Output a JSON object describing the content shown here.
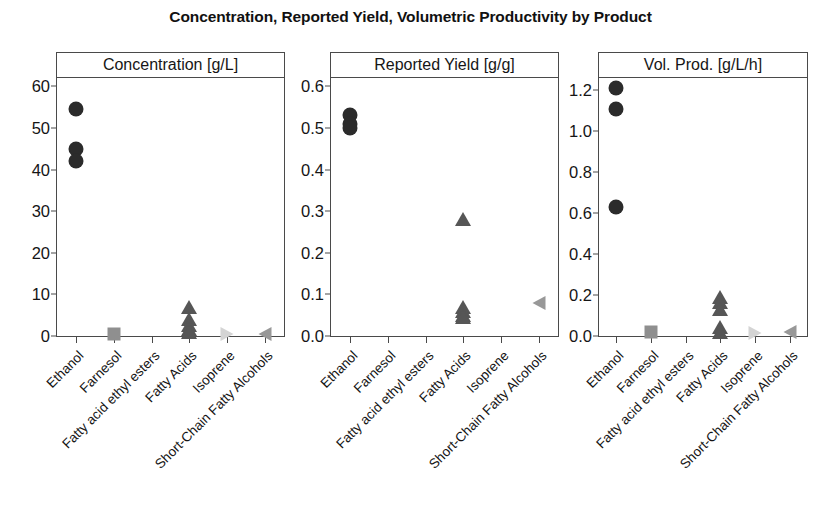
{
  "chart_data": {
    "type": "scatter",
    "title": "Concentration, Reported Yield, Volumetric Productivity by Product",
    "xlabel": "",
    "grid": false,
    "legend": "none",
    "categories": [
      "Ethanol",
      "Farnesol",
      "Fatty acid ethyl esters",
      "Fatty Acids",
      "Isoprene",
      "Short-Chain Fatty Alcohols"
    ],
    "marker_styles": {
      "Ethanol": "circle",
      "Farnesol": "square",
      "Fatty acid ethyl esters": "diamond",
      "Fatty Acids": "triangle-up",
      "Isoprene": "triangle-right",
      "Short-Chain Fatty Alcohols": "triangle-left"
    },
    "marker_colors": {
      "Ethanol": "#2b2b2b",
      "Farnesol": "#8f8f8f",
      "Fatty acid ethyl esters": "#9a9a9a",
      "Fatty Acids": "#565656",
      "Isoprene": "#d4d4d4",
      "Short-Chain Fatty Alcohols": "#989898"
    },
    "panels": [
      {
        "id": "concentration",
        "strip_label": "Concentration [g/L]",
        "ylabel": "Concentration [g/L]",
        "ylim": [
          0,
          62
        ],
        "yticks": [
          0,
          10,
          20,
          30,
          40,
          50,
          60
        ],
        "ytick_labels": [
          "0",
          "10",
          "20",
          "30",
          "40",
          "50",
          "60"
        ],
        "points": [
          {
            "category": "Ethanol",
            "value": 54.5
          },
          {
            "category": "Ethanol",
            "value": 45.0
          },
          {
            "category": "Ethanol",
            "value": 42.0
          },
          {
            "category": "Farnesol",
            "value": 0.5
          },
          {
            "category": "Fatty Acids",
            "value": 7.0
          },
          {
            "category": "Fatty Acids",
            "value": 4.2
          },
          {
            "category": "Fatty Acids",
            "value": 2.6
          },
          {
            "category": "Fatty Acids",
            "value": 1.7
          },
          {
            "category": "Fatty Acids",
            "value": 1.0
          },
          {
            "category": "Isoprene",
            "value": 0.5
          },
          {
            "category": "Short-Chain Fatty Alcohols",
            "value": 0.6
          }
        ]
      },
      {
        "id": "reported-yield",
        "strip_label": "Reported Yield [g/g]",
        "ylabel": "Reported Yield [g/g]",
        "ylim": [
          0.0,
          0.62
        ],
        "yticks": [
          0.0,
          0.1,
          0.2,
          0.3,
          0.4,
          0.5,
          0.6
        ],
        "ytick_labels": [
          "0.0",
          "0.1",
          "0.2",
          "0.3",
          "0.4",
          "0.5",
          "0.6"
        ],
        "points": [
          {
            "category": "Ethanol",
            "value": 0.53
          },
          {
            "category": "Ethanol",
            "value": 0.51
          },
          {
            "category": "Ethanol",
            "value": 0.5
          },
          {
            "category": "Fatty Acids",
            "value": 0.28
          },
          {
            "category": "Fatty Acids",
            "value": 0.07
          },
          {
            "category": "Fatty Acids",
            "value": 0.06
          },
          {
            "category": "Fatty Acids",
            "value": 0.05
          },
          {
            "category": "Fatty Acids",
            "value": 0.045
          },
          {
            "category": "Short-Chain Fatty Alcohols",
            "value": 0.08
          }
        ]
      },
      {
        "id": "vol-prod",
        "strip_label": "Vol. Prod. [g/L/h]",
        "ylabel": "Vol. Prod. [g/L/h]",
        "ylim": [
          0.0,
          1.26
        ],
        "yticks": [
          0.0,
          0.2,
          0.4,
          0.6,
          0.8,
          1.0,
          1.2
        ],
        "ytick_labels": [
          "0.0",
          "0.2",
          "0.4",
          "0.6",
          "0.8",
          "1.0",
          "1.2"
        ],
        "points": [
          {
            "category": "Ethanol",
            "value": 1.21
          },
          {
            "category": "Ethanol",
            "value": 1.11
          },
          {
            "category": "Ethanol",
            "value": 0.63
          },
          {
            "category": "Farnesol",
            "value": 0.02
          },
          {
            "category": "Fatty Acids",
            "value": 0.19
          },
          {
            "category": "Fatty Acids",
            "value": 0.165
          },
          {
            "category": "Fatty Acids",
            "value": 0.13
          },
          {
            "category": "Fatty Acids",
            "value": 0.045
          },
          {
            "category": "Fatty Acids",
            "value": 0.02
          },
          {
            "category": "Isoprene",
            "value": 0.015
          },
          {
            "category": "Short-Chain Fatty Alcohols",
            "value": 0.02
          }
        ]
      }
    ]
  },
  "layout": {
    "panel_geometry": [
      {
        "left": 56,
        "width": 229
      },
      {
        "left": 330,
        "width": 229
      },
      {
        "left": 598,
        "width": 210
      }
    ],
    "marker_size": 15
  }
}
